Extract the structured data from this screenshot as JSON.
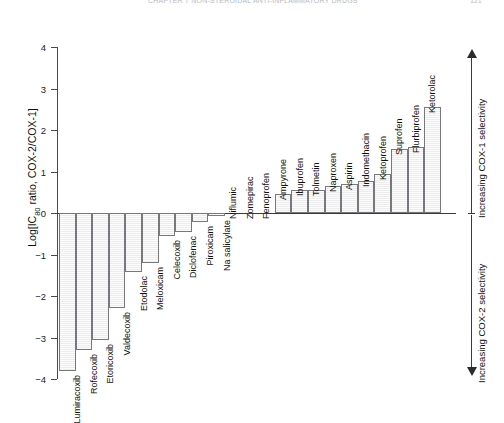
{
  "header": {
    "running_text": "CHAPTER 7  NON-STEROIDAL ANTI-INFLAMMATORY DRUGS",
    "page_number": "121"
  },
  "axis": {
    "y_title_prefix": "Log[IC",
    "y_title_sub": "80",
    "y_title_suffix": " ratio, COX-2/COX-1]",
    "y_ticks": [
      "4",
      "3",
      "2",
      "1",
      "0",
      "−1",
      "−2",
      "−3",
      "−4"
    ]
  },
  "annotations": {
    "cox1": "Increasing COX-1 selectivity",
    "cox2": "Increasing COX-2 selectivity",
    "arrow_up": "arrow-up-icon",
    "arrow_down": "arrow-down-icon"
  },
  "chart_data": {
    "type": "bar",
    "title": "",
    "xlabel": "",
    "ylabel": "Log[IC80 ratio, COX-2/COX-1]",
    "ylim": [
      -4,
      4
    ],
    "grid": false,
    "legend": "none",
    "categories": [
      "Lumiracoxib",
      "Rofecoxib",
      "Etoricoxib",
      "Valdecoxib",
      "Etodolac",
      "Meloxicam",
      "Celecoxib",
      "Diclofenac",
      "Piroxicam",
      "Na salicylate",
      "Niflumic",
      "Zomepirac",
      "Fenoprofen",
      "Ampyrone",
      "Ibuprofen",
      "Tolmetin",
      "Naproxen",
      "Aspirin",
      "Indomethacin",
      "Ketoprofen",
      "Suprofen",
      "Flurbiprofen",
      "Ketorolac"
    ],
    "values": [
      -3.8,
      -3.3,
      -3.05,
      -2.3,
      -1.42,
      -1.2,
      -0.55,
      -0.45,
      -0.22,
      -0.08,
      0.0,
      0.0,
      0.0,
      0.45,
      0.55,
      0.55,
      0.65,
      0.7,
      0.78,
      0.93,
      1.55,
      1.6,
      2.55
    ]
  }
}
